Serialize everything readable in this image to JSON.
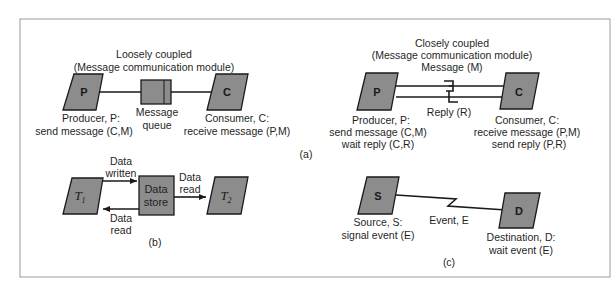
{
  "figure": {
    "panel_a_label": "(a)",
    "panel_b_label": "(b)",
    "panel_c_label": "(c)",
    "loose": {
      "title_1": "Loosely coupled",
      "title_2": "(Message communication module)",
      "producer_box": "P",
      "consumer_box": "C",
      "producer_label_1": "Producer, P:",
      "producer_label_2": "send message (C,M)",
      "queue_label_1": "Message",
      "queue_label_2": "queue",
      "consumer_label_1": "Consumer, C:",
      "consumer_label_2": "receive message (P,M)"
    },
    "close": {
      "title_1": "Closely coupled",
      "title_2": "(Message communication module)",
      "title_3": "Message (M)",
      "producer_box": "P",
      "consumer_box": "C",
      "reply_label": "Reply (R)",
      "producer_label_1": "Producer, P:",
      "producer_label_2": "send message (C,M)",
      "producer_label_3": "wait reply (C,R)",
      "consumer_label_1": "Consumer, C:",
      "consumer_label_2": "receive message (P,M)",
      "consumer_label_3": "send reply (P,R)"
    },
    "datastore": {
      "t1": "T",
      "t1_sub": "1",
      "t2": "T",
      "t2_sub": "2",
      "store_1": "Data",
      "store_2": "store",
      "written_1": "Data",
      "written_2": "written",
      "read_back_1": "Data",
      "read_back_2": "read",
      "read_fwd_1": "Data",
      "read_fwd_2": "read"
    },
    "event": {
      "source_box": "S",
      "dest_box": "D",
      "event_label": "Event, E",
      "source_label_1": "Source, S:",
      "source_label_2": "signal event (E)",
      "dest_label_1": "Destination, D:",
      "dest_label_2": "wait event (E)"
    }
  }
}
